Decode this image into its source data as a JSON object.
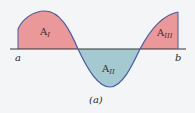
{
  "diagram": {
    "caption": "(a)",
    "axis_labels": {
      "left": "a",
      "right": "b"
    },
    "regions": [
      {
        "name": "A",
        "sub": "I",
        "sign": "positive",
        "color": "#e8878a"
      },
      {
        "name": "A",
        "sub": "II",
        "sign": "negative",
        "color": "#9cc4cc"
      },
      {
        "name": "A",
        "sub": "III",
        "sign": "positive",
        "color": "#e8878a"
      }
    ],
    "colors": {
      "curve": "#4a5aa0",
      "axis": "#333333",
      "background": "#f4f5f7"
    }
  }
}
